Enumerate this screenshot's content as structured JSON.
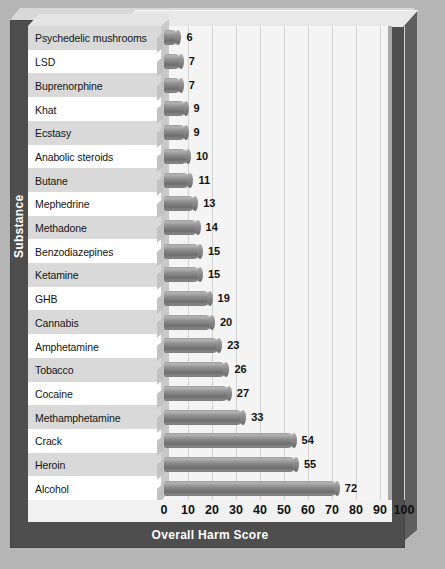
{
  "chart_data": {
    "type": "bar",
    "orientation": "horizontal",
    "title": "",
    "xlabel": "Overall Harm Score",
    "ylabel": "Substance",
    "xlim": [
      0,
      100
    ],
    "xticks": [
      "0",
      "10",
      "20",
      "30",
      "40",
      "50",
      "60",
      "70",
      "80",
      "90",
      "100"
    ],
    "grid": true,
    "legend": "none",
    "categories": [
      "Psychedelic mushrooms",
      "LSD",
      "Buprenorphine",
      "Khat",
      "Ecstasy",
      "Anabolic steroids",
      "Butane",
      "Mephedrine",
      "Methadone",
      "Benzodiazepines",
      "Ketamine",
      "GHB",
      "Cannabis",
      "Amphetamine",
      "Tobacco",
      "Cocaine",
      "Methamphetamine",
      "Crack",
      "Heroin",
      "Alcohol"
    ],
    "values": [
      6,
      7,
      7,
      9,
      9,
      10,
      11,
      13,
      14,
      15,
      15,
      19,
      20,
      23,
      26,
      27,
      33,
      54,
      55,
      72
    ],
    "value_labels": [
      "6",
      "7",
      "7",
      "9",
      "9",
      "10",
      "11",
      "13",
      "14",
      "15",
      "15",
      "19",
      "20",
      "23",
      "26",
      "27",
      "33",
      "54",
      "55",
      "72"
    ]
  },
  "colors": {
    "page_background": "#b5b5b5",
    "frame": "#4e4e4e",
    "plot_background": "#f4f4f4",
    "row_alt": "#d9d9d9",
    "row_base": "#ffffff",
    "bar": "#7c7c7c",
    "gridline": "#d3d3d3",
    "axis_text": "#101010",
    "title_text": "#ffffff"
  }
}
